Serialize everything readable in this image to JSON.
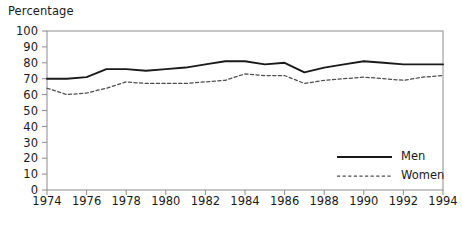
{
  "chart_data": {
    "type": "line",
    "title": "",
    "subtitle": "",
    "xlabel": "",
    "ylabel": "Percentage",
    "ylim": [
      0,
      100
    ],
    "xlim": [
      1974,
      1994
    ],
    "ytick_step": 10,
    "xtick_step": 2,
    "grid": false,
    "legend_position": "inside bottom-right",
    "yticks": [
      "100",
      "90",
      "80",
      "70",
      "60",
      "50",
      "40",
      "30",
      "20",
      "10",
      "0"
    ],
    "ytick_values": [
      100,
      90,
      80,
      70,
      60,
      50,
      40,
      30,
      20,
      10,
      0
    ],
    "xticks": [
      "1974",
      "1976",
      "1978",
      "1980",
      "1982",
      "1984",
      "1986",
      "1988",
      "1990",
      "1992",
      "1994"
    ],
    "xtick_values": [
      1974,
      1976,
      1978,
      1980,
      1982,
      1984,
      1986,
      1988,
      1990,
      1992,
      1994
    ],
    "x": [
      1974,
      1975,
      1976,
      1977,
      1978,
      1979,
      1980,
      1981,
      1982,
      1983,
      1984,
      1985,
      1986,
      1987,
      1988,
      1989,
      1990,
      1991,
      1992,
      1993,
      1994
    ],
    "series": [
      {
        "name": "Men",
        "style": "solid",
        "color": "#1a1a1a",
        "values": [
          70,
          70,
          71,
          76,
          76,
          75,
          76,
          77,
          79,
          81,
          81,
          79,
          80,
          74,
          77,
          79,
          81,
          80,
          79,
          79,
          79
        ]
      },
      {
        "name": "Women",
        "style": "dashed",
        "color": "#4d4d4d",
        "values": [
          64,
          60,
          61,
          64,
          68,
          67,
          67,
          67,
          68,
          69,
          73,
          72,
          72,
          67,
          69,
          70,
          71,
          70,
          69,
          71,
          72
        ]
      }
    ],
    "legend": [
      {
        "label": "Men",
        "style": "solid",
        "color": "#1a1a1a"
      },
      {
        "label": "Women",
        "style": "dashed",
        "color": "#4d4d4d"
      }
    ],
    "axis_color": "#8c8c8c",
    "frame": {
      "top": true,
      "right": true,
      "bottom": true,
      "left": true
    }
  }
}
